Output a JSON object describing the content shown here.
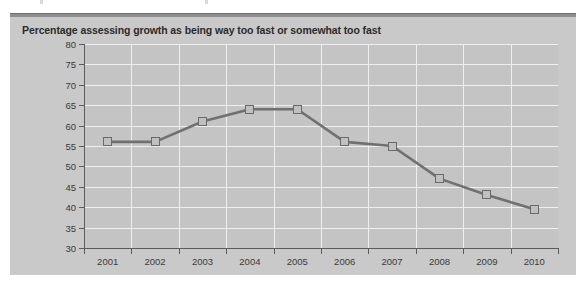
{
  "figure": {
    "background_color": "#ffffff",
    "panel_color": "#c9c9c9",
    "plot_color": "#c4c4c4",
    "gridline_color": "#efefef",
    "axis_color": "#5b5b5b",
    "series_color": "#707070",
    "marker_fill_color": "#c0c0c0",
    "marker_edge_color": "#6a6a6a",
    "title_color": "#2b2b2b"
  },
  "chart_data": {
    "type": "line",
    "title": "Percentage assessing growth as being way too fast or somewhat too fast",
    "xlabel": "",
    "ylabel": "",
    "categories": [
      "2001",
      "2002",
      "2003",
      "2004",
      "2005",
      "2006",
      "2007",
      "2008",
      "2009",
      "2010"
    ],
    "values": [
      56,
      56,
      61,
      64,
      64,
      56,
      55,
      47,
      43,
      39.5
    ],
    "series": [
      {
        "name": "Percentage assessing growth as being way too fast or somewhat too fast",
        "values": [
          56,
          56,
          61,
          64,
          64,
          56,
          55,
          47,
          43,
          39.5
        ]
      }
    ],
    "ylim": [
      30,
      80
    ],
    "ytick_labels": [
      "80",
      "75",
      "70",
      "65",
      "60",
      "55",
      "50",
      "45",
      "40",
      "35",
      "30"
    ],
    "ytick_values": [
      80,
      75,
      70,
      65,
      60,
      55,
      50,
      45,
      40,
      35,
      30
    ],
    "xtick_labels": [
      "2001",
      "2002",
      "2003",
      "2004",
      "2005",
      "2006",
      "2007",
      "2008",
      "2009",
      "2010"
    ],
    "grid": true,
    "legend": false,
    "legend_position": "none",
    "marker": "square"
  }
}
